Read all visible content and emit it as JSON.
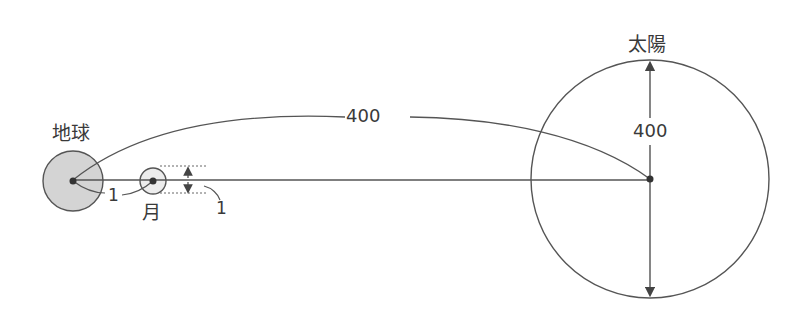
{
  "diagram": {
    "type": "scale-comparison",
    "bodies": {
      "earth": {
        "label": "地球",
        "fill": "#d4d4d4"
      },
      "moon": {
        "label": "月",
        "fill": "#ececec"
      },
      "sun": {
        "label": "太陽",
        "fill": "#ffffff"
      }
    },
    "labels": {
      "earth_moon_distance": "1",
      "moon_diameter": "1",
      "earth_sun_distance": "400",
      "sun_diameter": "400"
    },
    "colors": {
      "stroke": "#555555",
      "text": "#3a3a3a",
      "earth_fill": "#d4d4d4",
      "moon_fill": "#ececec"
    }
  }
}
